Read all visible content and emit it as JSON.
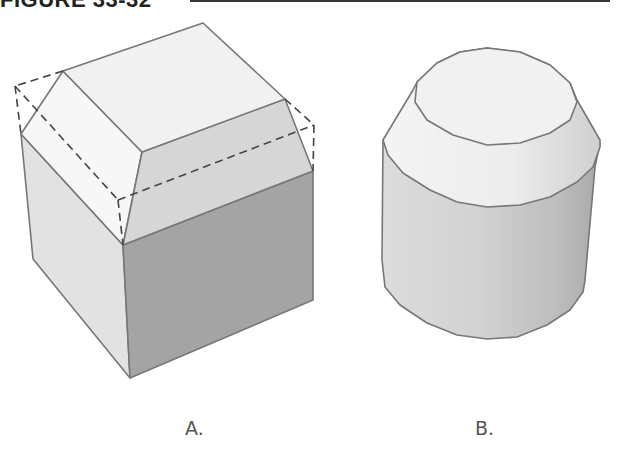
{
  "figure": {
    "title": "FIGURE 33-32",
    "panels": [
      {
        "id": "A",
        "label": "A.",
        "subject": "cube-with-chamfered-top-edges"
      },
      {
        "id": "B",
        "label": "B.",
        "subject": "cylinder-with-chamfered-top"
      }
    ],
    "colors": {
      "outline": "#777777",
      "top_face": "#f1f1f1",
      "chamfer_light": "#f7f7f7",
      "chamfer_mid": "#d6d6d6",
      "side_light": "#e2e2e2",
      "side_dark": "#a4a4a4",
      "dashed_line": "#444444",
      "rule": "#333333",
      "label_text": "#555555"
    }
  }
}
